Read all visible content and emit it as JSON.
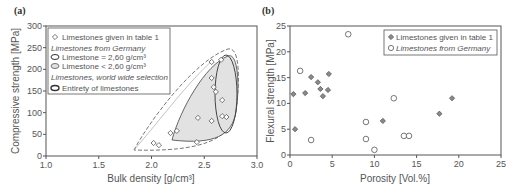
{
  "chart_data": [
    {
      "panel": "(a)",
      "type": "scatter",
      "xlabel": "Bulk density [g/cm³]",
      "ylabel": "Compressive strength [MPa]",
      "xlim": [
        1.0,
        3.0
      ],
      "ylim": [
        0,
        300
      ],
      "xticks": [
        "1.0",
        "1.5",
        "2.0",
        "2.5",
        "3.0"
      ],
      "yticks": [
        "0",
        "50",
        "100",
        "150",
        "200",
        "250",
        "300"
      ],
      "grid": false,
      "legend_position": "upper left",
      "legend": [
        {
          "label": "Limestones given in table 1",
          "marker": "open-diamond"
        },
        {
          "label": "Limestones from Germany",
          "style": "italic-heading"
        },
        {
          "label": "Limestone = 2,60 g/cm³",
          "marker": "solid-ellipse"
        },
        {
          "label": "Limestone < 2,60 g/cm³",
          "marker": "gray-filled-ellipse"
        },
        {
          "label": "Limestones, world wide selection",
          "style": "italic-heading"
        },
        {
          "label": "Entirety of limestones",
          "marker": "dashed-ellipse"
        }
      ],
      "series": [
        {
          "name": "Limestones given in table 1",
          "marker": "open-diamond",
          "points": [
            [
              2.57,
              217
            ],
            [
              2.66,
              222
            ],
            [
              2.57,
              180
            ],
            [
              2.59,
              159
            ],
            [
              2.61,
              148
            ],
            [
              2.67,
              129
            ],
            [
              2.44,
              88
            ],
            [
              2.57,
              81
            ],
            [
              2.67,
              92
            ],
            [
              2.71,
              90
            ],
            [
              2.18,
              53
            ],
            [
              2.24,
              58
            ],
            [
              2.02,
              30
            ],
            [
              2.07,
              25
            ],
            [
              2.43,
              32
            ]
          ]
        }
      ],
      "regions": [
        {
          "name": "Limestone = 2,60 g/cm³",
          "style": "solid outline"
        },
        {
          "name": "Limestone < 2,60 g/cm³",
          "style": "gray fill, solid outline"
        },
        {
          "name": "Entirety of limestones",
          "style": "dashed outline"
        }
      ]
    },
    {
      "panel": "(b)",
      "type": "scatter",
      "xlabel": "Porosity [Vol.%]",
      "ylabel": "Flexural strength [MPa]",
      "xlim": [
        0,
        25
      ],
      "ylim": [
        0,
        25
      ],
      "xticks": [
        "0",
        "5",
        "10",
        "15",
        "20",
        "25"
      ],
      "yticks": [
        "0",
        "5",
        "10",
        "15",
        "20",
        "25"
      ],
      "grid": false,
      "legend_position": "upper right",
      "legend": [
        {
          "label": "Limestones given in table 1",
          "marker": "gray-diamond"
        },
        {
          "label": "Limestones from Germany",
          "marker": "open-circle",
          "italic": true
        }
      ],
      "series": [
        {
          "name": "Limestones given in table 1",
          "marker": "gray-diamond",
          "points": [
            [
              0.4,
              11.8
            ],
            [
              0.6,
              5.0
            ],
            [
              1.8,
              12.0
            ],
            [
              2.5,
              15.1
            ],
            [
              3.3,
              14.1
            ],
            [
              3.6,
              12.8
            ],
            [
              3.9,
              11.4
            ],
            [
              4.5,
              12.6
            ],
            [
              4.6,
              15.7
            ],
            [
              11.0,
              6.6
            ],
            [
              17.7,
              8.0
            ],
            [
              19.2,
              11.0
            ]
          ]
        },
        {
          "name": "Limestones from Germany",
          "marker": "open-circle",
          "points": [
            [
              1.2,
              16.3
            ],
            [
              2.5,
              2.9
            ],
            [
              6.9,
              23.4
            ],
            [
              9.0,
              6.4
            ],
            [
              9.0,
              3.1
            ],
            [
              10.0,
              1.0
            ],
            [
              12.3,
              11.0
            ],
            [
              13.5,
              3.7
            ],
            [
              14.1,
              3.7
            ]
          ]
        }
      ]
    }
  ],
  "colors": {
    "axis": "#555555",
    "text": "#555555",
    "fill_gray": "#e2e2e2",
    "diamond_fill": "#8a8a8a"
  }
}
